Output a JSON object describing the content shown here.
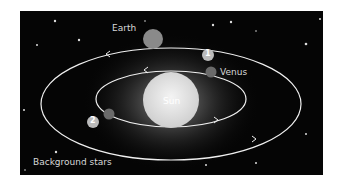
{
  "labels": {
    "earth": "Earth",
    "venus": "Venus",
    "sun": "Sun",
    "background_stars": "Background stars",
    "marker_1": "1",
    "marker_2": "2"
  },
  "colors": {
    "background": "#050505",
    "orbit": "#f0f0f0",
    "sun": "#e8e8e8"
  }
}
